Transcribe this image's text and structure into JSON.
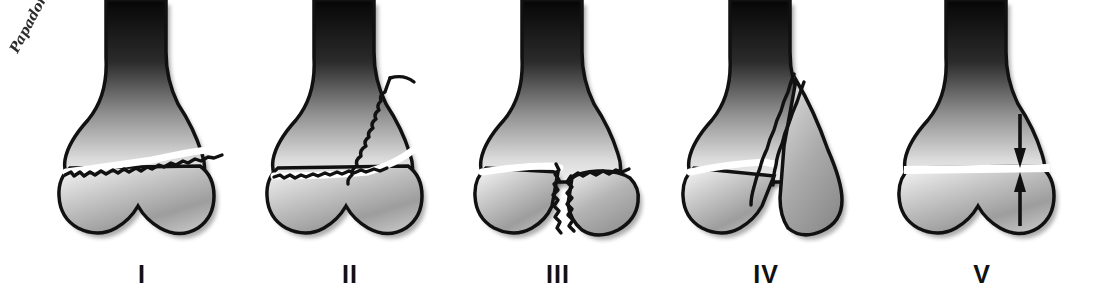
{
  "image": {
    "title": "Salter-Harris physeal fracture classification",
    "background_color": "#ffffff",
    "ink_color": "#111111",
    "width": 1103,
    "height": 291
  },
  "watermark": {
    "text": "Papadonikolakis",
    "rotation_deg": -62,
    "color": "#1c1c1c"
  },
  "figures": [
    {
      "label": "I",
      "name": "salter-harris-type-1",
      "description": "Transverse fracture through the physis separating epiphysis from metaphysis",
      "fracture_path": "transverse-through-physis",
      "x": 32
    },
    {
      "label": "II",
      "name": "salter-harris-type-2",
      "description": "Fracture through physis exiting into metaphysis leaving a triangular metaphyseal fragment",
      "fracture_path": "physis-plus-metaphyseal-fragment",
      "x": 240
    },
    {
      "label": "III",
      "name": "salter-harris-type-3",
      "description": "Fracture through physis exiting through the epiphysis with displaced epiphyseal fragment",
      "fracture_path": "physis-plus-epiphyseal-fragment",
      "x": 448
    },
    {
      "label": "IV",
      "name": "salter-harris-type-4",
      "description": "Oblique fracture crossing metaphysis, physis and epiphysis",
      "fracture_path": "metaphysis-physis-epiphysis",
      "x": 656
    },
    {
      "label": "V",
      "name": "salter-harris-type-5",
      "description": "Crush/compression injury of the physis indicated by opposing arrows",
      "fracture_path": "compression-arrows",
      "x": 872,
      "annotation": {
        "name": "compression-arrows",
        "arrow_count": 2,
        "direction": "toward-physis"
      }
    }
  ],
  "bone": {
    "part": "distal humerus",
    "shaft_tone_top": "#0a0a0a",
    "shaft_tone_bottom": "#d6d6d6",
    "epiphysis_tone": "#bdbdbd",
    "cortex_color": "#111111"
  }
}
